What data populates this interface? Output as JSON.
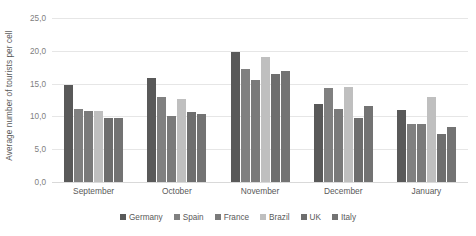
{
  "chart_data": {
    "type": "bar",
    "title": "",
    "subtitle": "",
    "xlabel": "",
    "ylabel": "Average number of tourists per cell",
    "ylim": [
      0,
      25
    ],
    "ytick_labels": [
      "25,0",
      "20,0",
      "15,0",
      "10,0",
      "5,0",
      "0,0"
    ],
    "ytick_values": [
      25,
      20,
      15,
      10,
      5,
      0
    ],
    "grid": true,
    "legend_position": "bottom",
    "categories": [
      "September",
      "October",
      "November",
      "December",
      "January"
    ],
    "series": [
      {
        "name": "Germany",
        "color": "#595959",
        "values": [
          14.8,
          15.9,
          19.8,
          11.9,
          11.0
        ]
      },
      {
        "name": "Spain",
        "color": "#808080",
        "values": [
          11.2,
          13.0,
          17.2,
          14.3,
          8.8
        ]
      },
      {
        "name": "France",
        "color": "#7a7a7a",
        "values": [
          10.9,
          10.0,
          15.6,
          11.2,
          8.8
        ]
      },
      {
        "name": "Brazil",
        "color": "#bfbfbf",
        "values": [
          10.8,
          12.6,
          19.0,
          14.5,
          12.9
        ]
      },
      {
        "name": "UK",
        "color": "#6e6e6e",
        "values": [
          9.7,
          10.6,
          16.5,
          9.8,
          7.3
        ]
      },
      {
        "name": "Italy",
        "color": "#737373",
        "values": [
          9.7,
          10.4,
          16.9,
          11.6,
          8.4
        ]
      }
    ]
  }
}
